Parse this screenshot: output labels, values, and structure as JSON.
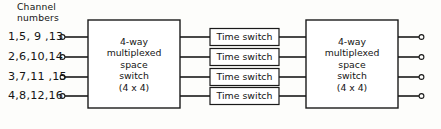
{
  "diagram": {
    "title_label": "Channel numbers",
    "header": {
      "line1": "Channel",
      "line2": "numbers"
    },
    "channel_labels": [
      "1,5, 9 ,13",
      "2,6,10,14",
      "3,7,11 ,15",
      "4,8,12,16"
    ],
    "left_switch": {
      "name": "4-way multiplexed space switch (4 x 4)",
      "lines": [
        "4-way",
        "multiplexed",
        "space",
        "switch",
        "(4 x 4)"
      ]
    },
    "right_switch": {
      "name": "4-way multiplexed space switch (4 x 4)",
      "lines": [
        "4-way",
        "multiplexed",
        "space",
        "switch",
        "(4 x 4)"
      ]
    },
    "time_switches": [
      "Time switch",
      "Time switch",
      "Time switch",
      "Time switch"
    ],
    "colors": {
      "stroke": "#1a1a1a",
      "background": "#fdfdfb",
      "box_fill": "#ffffff",
      "text": "#141414"
    }
  }
}
